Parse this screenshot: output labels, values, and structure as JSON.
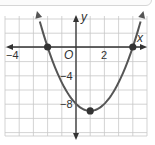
{
  "chart_data": {
    "type": "line",
    "title": "",
    "function": "y = x^2 - 2x - 8",
    "xlabel": "x",
    "ylabel": "y",
    "origin_label": "O",
    "xlim": [
      -5,
      5
    ],
    "ylim": [
      -12,
      4
    ],
    "x_grid_step": 1,
    "y_grid_step": 2,
    "grid": true,
    "x_tick_labels": [
      {
        "value": -4,
        "label": "−4"
      },
      {
        "value": 2,
        "label": "2"
      }
    ],
    "y_tick_labels": [
      {
        "value": -4,
        "label": "−4"
      },
      {
        "value": -8,
        "label": "−8"
      }
    ],
    "series": [
      {
        "name": "parabola",
        "x": [
          -2.6,
          -2,
          -1,
          0,
          1,
          2,
          3,
          4,
          4.6
        ],
        "y": [
          3.96,
          0,
          -5,
          -8,
          -9,
          -8,
          -5,
          0,
          3.96
        ]
      }
    ],
    "points": [
      {
        "name": "x-intercept-left",
        "x": -2,
        "y": 0
      },
      {
        "name": "vertex",
        "x": 1,
        "y": -9
      },
      {
        "name": "x-intercept-right",
        "x": 4,
        "y": 0
      }
    ],
    "colors": {
      "curve": "#555555",
      "grid": "#c8c8c8",
      "axis": "#333333",
      "point": "#333333"
    }
  }
}
